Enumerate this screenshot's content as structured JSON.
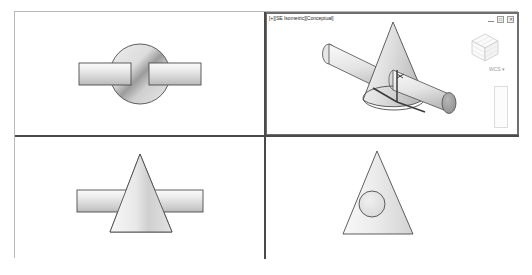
{
  "app": {
    "title": "AutoCAD Model Space - Four Viewport Layout",
    "background_color": "#ffffff",
    "frame_border_color": "#b9b9b9",
    "viewport_divider_color": "#4a4a4a",
    "active_viewport_border_color": "#6e6e6e",
    "model_fill_light": "#f2f2f2",
    "model_fill_mid": "#c9c9c9",
    "model_fill_dark": "#8f8f8f",
    "model_outline_color": "#4d4d4d"
  },
  "viewports": [
    {
      "id": "top-left",
      "name": "Top",
      "label": "",
      "active": false,
      "content_description": "Top view: cone seen from above as shaded circle with horizontal cylinder passing through"
    },
    {
      "id": "top-right",
      "name": "SE Isometric",
      "label": "[+][SE Isometric][Conceptual]",
      "active": true,
      "content_description": "SE Isometric conceptual shaded view: cone with cylinder intersecting, UCS axis icon"
    },
    {
      "id": "bottom-left",
      "name": "Front",
      "label": "",
      "active": false,
      "content_description": "Front view: cone triangle profile with horizontal cylinder crossing"
    },
    {
      "id": "bottom-right",
      "name": "Right",
      "label": "",
      "active": false,
      "content_description": "Right side view: cone triangle profile with circular cylinder end"
    }
  ],
  "active_viewport": {
    "label": "[+][SE Isometric][Conceptual]",
    "view_style_tag": "[+]",
    "view_direction_tag": "[SE Isometric]",
    "visual_style_tag": "[Conceptual]",
    "window_controls": {
      "minimize_label": "—",
      "maximize_label": "□",
      "close_label": "✕"
    },
    "viewcube": {
      "name": "view-cube",
      "coordinate_system_label": "WCS",
      "dropdown_glyph": "▾"
    },
    "navigation_bar": {
      "name": "navigation-bar"
    },
    "ucs_icon": {
      "name": "ucs-axis-icon",
      "axes": [
        "X",
        "Y",
        "Z"
      ]
    }
  }
}
